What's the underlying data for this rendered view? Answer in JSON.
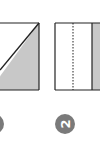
{
  "diagram": {
    "type": "paper-folding-steps",
    "colors": {
      "stroke": "#222222",
      "shade": "#c8c8c8",
      "badge": "#7a7a7a",
      "badge_text": "#ffffff"
    },
    "steps": [
      {
        "number": "1",
        "description": "square with diagonal fold, lower-right triangle shaded",
        "partially_visible": true
      },
      {
        "number": "2",
        "description": "square with dotted fold line and solid fold line, right strip shaded"
      }
    ]
  }
}
